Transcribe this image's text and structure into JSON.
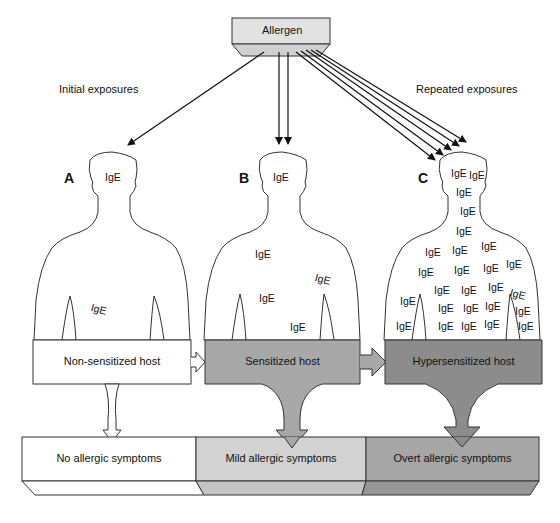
{
  "title": "Allergen",
  "left_caption": "Initial exposures",
  "right_caption": "Repeated exposures",
  "panels": [
    {
      "letter": "A",
      "host_label": "Non-sensitized host",
      "outcome_label": "No allergic symptoms",
      "ige_count": 2
    },
    {
      "letter": "B",
      "host_label": "Sensitized host",
      "outcome_label": "Mild allergic symptoms",
      "ige_count": 5
    },
    {
      "letter": "C",
      "host_label": "Hypersensitized host",
      "outcome_label": "Overt allergic symptoms",
      "ige_count": 29
    }
  ],
  "ige_label": "IgE",
  "colors": {
    "allergen_box": "#e2e2e2",
    "host_a": "#ffffff",
    "host_b": "#a8a8a8",
    "host_c": "#8c8c8c",
    "outcome_a": "#ffffff",
    "outcome_b": "#d2d2d2",
    "outcome_c": "#a6a6a6",
    "outline": "#333333"
  }
}
